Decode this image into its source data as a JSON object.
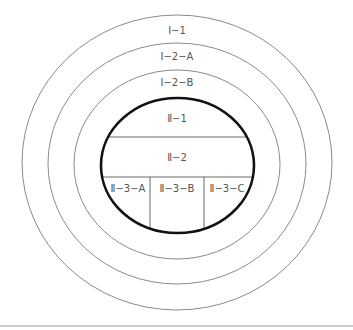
{
  "diagram": {
    "rings": [
      {
        "id": "ring-1",
        "label": "Ⅰ−1"
      },
      {
        "id": "ring-2a",
        "label": "Ⅰ−2−A"
      },
      {
        "id": "ring-2b",
        "label": "Ⅰ−2−B"
      }
    ],
    "core": {
      "top": {
        "label": "Ⅱ−1"
      },
      "middle": {
        "label": "Ⅱ−2"
      },
      "bottom": [
        {
          "label": "Ⅱ−3−A"
        },
        {
          "label": "Ⅱ−3−B"
        },
        {
          "label": "Ⅱ−3−C"
        }
      ]
    },
    "colors": {
      "ring_stroke": "#8a8a8a",
      "core_stroke": "#111111",
      "text": "#555555",
      "background": "#ffffff"
    }
  }
}
